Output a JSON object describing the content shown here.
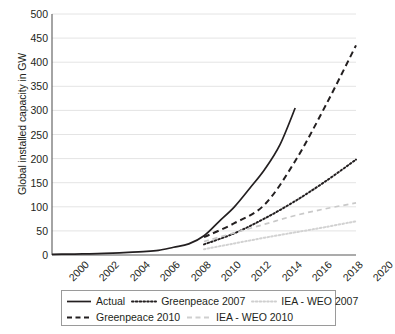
{
  "chart_data": {
    "type": "line",
    "title": "",
    "xlabel": "",
    "ylabel": "Global installed capacity in GW",
    "xlim": [
      2000,
      2020
    ],
    "ylim": [
      0,
      500
    ],
    "ytick_step": 50,
    "xtick_step": 2,
    "grid": "horizontal",
    "legend_position": "below-plot",
    "xticks": [
      "2000",
      "2002",
      "2004",
      "2006",
      "2008",
      "2010",
      "2012",
      "2014",
      "2016",
      "2018",
      "2020"
    ],
    "yticks": [
      "0",
      "50",
      "100",
      "150",
      "200",
      "250",
      "300",
      "350",
      "400",
      "450",
      "500"
    ],
    "series": [
      {
        "name": "Actual",
        "style": "solid",
        "color": "#231f20",
        "width": 1.7,
        "x": [
          2000,
          2001,
          2002,
          2003,
          2004,
          2005,
          2006,
          2007,
          2008,
          2009,
          2010,
          2011,
          2012,
          2013,
          2014,
          2015,
          2016
        ],
        "values": [
          1.3,
          1.8,
          2.2,
          2.8,
          3.9,
          5.4,
          7.0,
          9.5,
          16,
          23,
          40,
          70,
          100,
          138,
          178,
          229,
          305
        ]
      },
      {
        "name": "Greenpeace 2007",
        "style": "dotted",
        "color": "#231f20",
        "width": 2.0,
        "x": [
          2010,
          2012,
          2014,
          2016,
          2018,
          2020
        ],
        "values": [
          22,
          45,
          76,
          112,
          153,
          198
        ]
      },
      {
        "name": "IEA - WEO 2007",
        "style": "dashed",
        "color": "#c9c9c9",
        "width": 1.7,
        "x": [
          2010,
          2012,
          2014,
          2016,
          2018,
          2020
        ],
        "values": [
          28,
          46,
          64,
          82,
          96,
          108
        ]
      },
      {
        "name": "Greenpeace 2010",
        "style": "dashed",
        "color": "#231f20",
        "width": 2.0,
        "x": [
          2010,
          2012,
          2014,
          2016,
          2018,
          2020
        ],
        "values": [
          37,
          66,
          105,
          195,
          310,
          435
        ]
      },
      {
        "name": "IEA - WEO 2010",
        "style": "dotted",
        "color": "#d2d2d2",
        "width": 2.0,
        "x": [
          2010,
          2012,
          2014,
          2016,
          2018,
          2020
        ],
        "values": [
          12,
          24,
          36,
          47,
          58,
          70
        ]
      }
    ]
  },
  "legend": {
    "rows": [
      [
        {
          "label": "Actual",
          "swatch": "solid-black"
        },
        {
          "label": "Greenpeace 2007",
          "swatch": "dotted-black"
        },
        {
          "label": "IEA - WEO 2007",
          "swatch": "dotted-gray"
        }
      ],
      [
        {
          "label": "Greenpeace 2010",
          "swatch": "dashed-black"
        },
        {
          "label": "IEA - WEO 2010",
          "swatch": "dashed-gray"
        }
      ]
    ]
  },
  "colors": {
    "ink": "#231f20",
    "grid": "#e4e4e4",
    "axis": "#595959",
    "light_series": "#cfcfcf"
  }
}
